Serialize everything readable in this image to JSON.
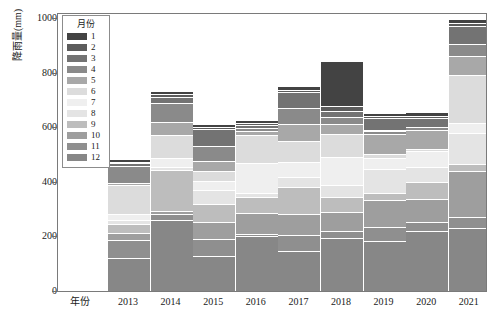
{
  "chart_data": {
    "type": "bar",
    "stacked": true,
    "title": "",
    "xlabel": "年份",
    "ylabel": "降雨量(mm)",
    "legend_title": "月份",
    "legend_position": "top-left-inside",
    "grid": false,
    "ylim": [
      0,
      1000
    ],
    "yticks": [
      0,
      200,
      400,
      600,
      800,
      1000
    ],
    "categories": [
      "2013",
      "2014",
      "2015",
      "2016",
      "2017",
      "2018",
      "2019",
      "2020",
      "2021"
    ],
    "stack_order_bottom_to_top": [
      "12",
      "11",
      "10",
      "9",
      "8",
      "7",
      "6",
      "5",
      "4",
      "3",
      "2",
      "1"
    ],
    "series": [
      {
        "name": "1",
        "color": "#434343",
        "values": [
          8,
          14,
          10,
          12,
          14,
          168,
          10,
          12,
          16
        ]
      },
      {
        "name": "2",
        "color": "#5c5c5c",
        "values": [
          6,
          10,
          8,
          6,
          8,
          18,
          7,
          8,
          10
        ]
      },
      {
        "name": "3",
        "color": "#737373",
        "values": [
          10,
          22,
          62,
          10,
          60,
          22,
          46,
          34,
          66
        ]
      },
      {
        "name": "4",
        "color": "#8a8a8a",
        "values": [
          62,
          70,
          54,
          12,
          58,
          26,
          14,
          10,
          44
        ]
      },
      {
        "name": "5",
        "color": "#a8a8a8",
        "values": [
          8,
          48,
          38,
          16,
          62,
          34,
          72,
          68,
          70
        ]
      },
      {
        "name": "6",
        "color": "#dcdcdc",
        "values": [
          106,
          84,
          36,
          102,
          78,
          84,
          16,
          10,
          176
        ]
      },
      {
        "name": "7",
        "color": "#efefef",
        "values": [
          22,
          30,
          34,
          108,
          56,
          104,
          40,
          56,
          36
        ]
      },
      {
        "name": "8",
        "color": "#e4e4e4",
        "values": [
          14,
          14,
          50,
          14,
          36,
          44,
          88,
          56,
          112
        ]
      },
      {
        "name": "9",
        "color": "#bdbdbd",
        "values": [
          34,
          150,
          68,
          60,
          98,
          56,
          26,
          62,
          26
        ]
      },
      {
        "name": "10",
        "color": "#9e9e9e",
        "values": [
          26,
          10,
          60,
          76,
          76,
          68,
          98,
          86,
          168
        ]
      },
      {
        "name": "11",
        "color": "#8f8f8f",
        "values": [
          66,
          22,
          62,
          10,
          58,
          24,
          50,
          32,
          40
        ]
      },
      {
        "name": "12",
        "color": "#878787",
        "values": [
          120,
          260,
          130,
          200,
          148,
          196,
          184,
          220,
          232
        ]
      }
    ]
  }
}
